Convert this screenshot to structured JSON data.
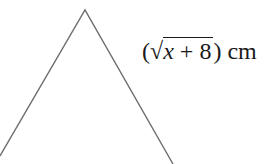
{
  "figure": {
    "type": "triangle",
    "apex": [
      85,
      10
    ],
    "left_base": [
      0,
      156
    ],
    "right_base": [
      173,
      164
    ],
    "stroke_color": "#6e6e6e"
  },
  "cutoff_text": {
    "line1": "e",
    "line2": "e"
  },
  "side_label": {
    "open_paren": "(",
    "radical": "√",
    "variable": "x",
    "operator": " + ",
    "constant": "8",
    "close_paren": ")",
    "unit": "cm"
  }
}
